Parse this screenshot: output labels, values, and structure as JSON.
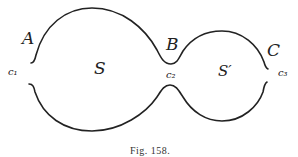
{
  "figure": {
    "caption": "Fig. 158.",
    "labels": {
      "A": "A",
      "B": "B",
      "C": "C",
      "S": "S",
      "S_prime": "S′",
      "c1": "c₁",
      "c2": "c₂",
      "c3": "c₃"
    },
    "stroke_color": "#222222"
  }
}
